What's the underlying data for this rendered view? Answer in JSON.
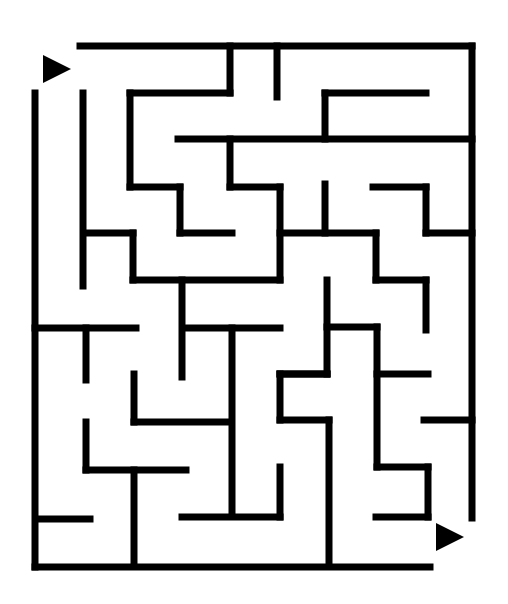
{
  "maze": {
    "background": "#ffffff",
    "wall_color": "#000000",
    "wall_width": 7,
    "start_marker": {
      "points": "43,55 43,83 71,69",
      "label": "start-arrow"
    },
    "end_marker": {
      "points": "436,523 436,551 464,537",
      "label": "end-arrow"
    },
    "walls": [
      [
        80,
        46,
        472,
        46
      ],
      [
        472,
        46,
        472,
        518
      ],
      [
        35,
        93,
        35,
        567
      ],
      [
        35,
        567,
        430,
        567
      ],
      [
        83,
        93,
        83,
        286
      ],
      [
        230,
        46,
        230,
        93
      ],
      [
        277,
        46,
        277,
        97
      ],
      [
        130,
        93,
        230,
        93
      ],
      [
        130,
        93,
        130,
        187
      ],
      [
        130,
        187,
        180,
        187
      ],
      [
        180,
        187,
        180,
        233
      ],
      [
        180,
        233,
        232,
        233
      ],
      [
        325,
        93,
        325,
        139
      ],
      [
        325,
        93,
        426,
        93
      ],
      [
        178,
        139,
        472,
        139
      ],
      [
        230,
        139,
        230,
        187
      ],
      [
        230,
        187,
        280,
        187
      ],
      [
        280,
        187,
        280,
        280
      ],
      [
        325,
        184,
        325,
        233
      ],
      [
        373,
        187,
        426,
        187
      ],
      [
        426,
        187,
        426,
        233
      ],
      [
        426,
        233,
        472,
        233
      ],
      [
        86,
        233,
        133,
        233
      ],
      [
        133,
        233,
        133,
        280
      ],
      [
        133,
        280,
        280,
        280
      ],
      [
        280,
        233,
        376,
        233
      ],
      [
        376,
        233,
        376,
        280
      ],
      [
        376,
        280,
        426,
        280
      ],
      [
        426,
        280,
        426,
        330
      ],
      [
        182,
        280,
        182,
        377
      ],
      [
        35,
        328,
        136,
        328
      ],
      [
        86,
        328,
        86,
        380
      ],
      [
        185,
        328,
        280,
        328
      ],
      [
        232,
        328,
        232,
        513
      ],
      [
        327,
        280,
        327,
        374
      ],
      [
        327,
        327,
        377,
        327
      ],
      [
        377,
        327,
        377,
        467
      ],
      [
        377,
        374,
        428,
        374
      ],
      [
        280,
        374,
        327,
        374
      ],
      [
        280,
        374,
        327,
        374
      ],
      [
        280,
        374,
        280,
        420
      ],
      [
        280,
        420,
        329,
        420
      ],
      [
        329,
        420,
        329,
        564
      ],
      [
        424,
        420,
        472,
        420
      ],
      [
        134,
        374,
        134,
        422
      ],
      [
        134,
        422,
        229,
        422
      ],
      [
        86,
        422,
        86,
        470
      ],
      [
        86,
        470,
        186,
        470
      ],
      [
        134,
        470,
        134,
        564
      ],
      [
        40,
        519,
        90,
        519
      ],
      [
        182,
        517,
        280,
        517
      ],
      [
        280,
        467,
        280,
        517
      ],
      [
        377,
        467,
        428,
        467
      ],
      [
        428,
        467,
        428,
        517
      ],
      [
        376,
        517,
        428,
        517
      ]
    ]
  }
}
